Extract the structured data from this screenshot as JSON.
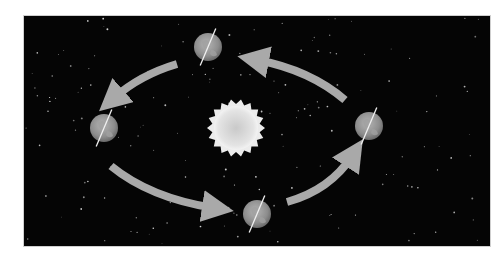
{
  "diagram": {
    "title": "",
    "background_color": "#050505",
    "arrow_color": "#a9a9a9",
    "sun": {
      "cx": 236,
      "cy": 128,
      "r": 25,
      "rays": 18,
      "color": "#e2e2e2"
    },
    "earths": [
      {
        "name": "top",
        "cx": 208,
        "cy": 47,
        "r": 14
      },
      {
        "name": "left",
        "cx": 104,
        "cy": 128,
        "r": 14
      },
      {
        "name": "bottom",
        "cx": 257,
        "cy": 214,
        "r": 14
      },
      {
        "name": "right",
        "cx": 369,
        "cy": 126,
        "r": 14
      }
    ],
    "axis_tilt_deg": 23,
    "orbit_direction": "counter-clockwise",
    "arrows": [
      {
        "name": "top-to-left",
        "path": "M 177 64 Q 140 75 114 98"
      },
      {
        "name": "left-to-bottom",
        "path": "M 111 166 Q 150 198 214 208"
      },
      {
        "name": "bottom-to-right",
        "path": "M 287 202 Q 330 190 352 156"
      },
      {
        "name": "right-to-top",
        "path": "M 345 100 Q 310 70 257 60"
      }
    ]
  }
}
